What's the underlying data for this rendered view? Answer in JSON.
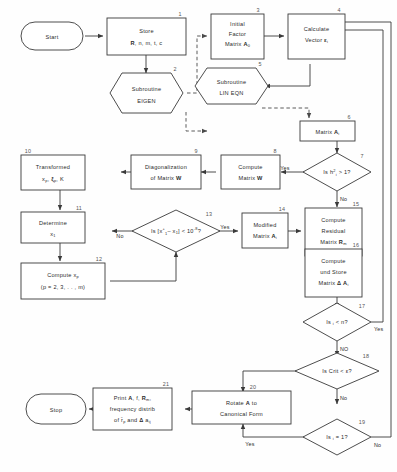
{
  "diagram": {
    "background_color": "#ffffff",
    "line_color": "#3a3a3a",
    "text_color": "#2b2b2b"
  },
  "nodes": {
    "start": {
      "num": "",
      "shape": "terminator",
      "lines": [
        "Start"
      ]
    },
    "n1": {
      "num": "1",
      "shape": "process",
      "lines": [
        "Store",
        "R, n, m, t, c"
      ]
    },
    "n2": {
      "num": "2",
      "shape": "hexagon",
      "lines": [
        "Subroutine",
        "EIGEN"
      ]
    },
    "n3": {
      "num": "3",
      "shape": "process",
      "lines": [
        "Initial",
        "Factor",
        "Matrix A0"
      ]
    },
    "n4": {
      "num": "4",
      "shape": "process",
      "lines": [
        "Calculate",
        "Vector εi"
      ]
    },
    "n5": {
      "num": "5",
      "shape": "hexagon",
      "lines": [
        "Subroutine",
        "LIN EQN"
      ]
    },
    "n6": {
      "num": "6",
      "shape": "process",
      "lines": [
        "Matrix Ai"
      ]
    },
    "n7": {
      "num": "7",
      "shape": "decision",
      "lines": [
        "Is h²i > 1?"
      ]
    },
    "n8": {
      "num": "8",
      "shape": "process",
      "lines": [
        "Compute",
        "Matrix W"
      ]
    },
    "n9": {
      "num": "9",
      "shape": "process",
      "lines": [
        "Diagonalization",
        "of Matrix W"
      ]
    },
    "n10": {
      "num": "10",
      "shape": "process",
      "lines": [
        "Transformed",
        "xp, ξp, K"
      ]
    },
    "n11": {
      "num": "11",
      "shape": "process",
      "lines": [
        "Determine",
        "x1"
      ]
    },
    "n12": {
      "num": "12",
      "shape": "process",
      "lines": [
        "Compute xp",
        "(p = 2, 3, . . , m)"
      ]
    },
    "n13": {
      "num": "13",
      "shape": "decision",
      "lines": [
        "Is [x⁺1 - x1] < 10⁻⁸?"
      ]
    },
    "n14": {
      "num": "14",
      "shape": "process",
      "lines": [
        "Modified",
        "Matrix Ai"
      ]
    },
    "n15": {
      "num": "15",
      "shape": "process",
      "lines": [
        "Compute",
        "Residual",
        "Matrix Rm"
      ]
    },
    "n16": {
      "num": "16",
      "shape": "process",
      "lines": [
        "Compute",
        "und Store",
        "Matrix Δ Ai"
      ]
    },
    "n17": {
      "num": "17",
      "shape": "decision",
      "lines": [
        "Is i < n?"
      ]
    },
    "n18": {
      "num": "18",
      "shape": "decision",
      "lines": [
        "Is Crit < ε?"
      ]
    },
    "n19": {
      "num": "19",
      "shape": "decision",
      "lines": [
        "Is i = 1?"
      ]
    },
    "n20": {
      "num": "20",
      "shape": "process",
      "lines": [
        "Rotate A to",
        "Canonical Form"
      ]
    },
    "n21": {
      "num": "21",
      "shape": "process",
      "lines": [
        "Print A, f, Rm,",
        "frequency distrib",
        "of r̄p and Δ aij"
      ]
    },
    "stop": {
      "num": "",
      "shape": "terminator",
      "lines": [
        "Stop"
      ]
    }
  },
  "edge_labels": {
    "e7_yes": "Yes",
    "e7_no": "No",
    "e13_yes": "Yes",
    "e13_no": "No",
    "e17_yes": "Yes",
    "e17_no": "NO",
    "e18_no": "No",
    "e19_yes": "Yes",
    "e19_no": "No"
  }
}
